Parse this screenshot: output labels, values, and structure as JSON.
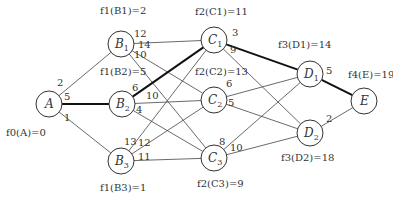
{
  "diagram": {
    "type": "multistage-shortest-path-graph",
    "nodes": [
      {
        "id": "A",
        "label": "A",
        "sub": "",
        "x": 49,
        "y": 104,
        "f_label": "f0(A)=0",
        "fx": 6,
        "fy": 136
      },
      {
        "id": "B1",
        "label": "B",
        "sub": "1",
        "x": 121,
        "y": 44,
        "f_label": "f1(B1)=2",
        "fx": 100,
        "fy": 14
      },
      {
        "id": "B2",
        "label": "B",
        "sub": "2",
        "x": 122,
        "y": 104,
        "f_label": "f1(B2)=5",
        "fx": 100,
        "fy": 75
      },
      {
        "id": "B3",
        "label": "B",
        "sub": "3",
        "x": 121,
        "y": 161,
        "f_label": "f1(B3)=1",
        "fx": 100,
        "fy": 191
      },
      {
        "id": "C1",
        "label": "C",
        "sub": "1",
        "x": 214,
        "y": 40,
        "f_label": "f2(C1)=11",
        "fx": 195,
        "fy": 15
      },
      {
        "id": "C2",
        "label": "C",
        "sub": "2",
        "x": 214,
        "y": 100,
        "f_label": "f2(C2)=13",
        "fx": 195,
        "fy": 75
      },
      {
        "id": "C3",
        "label": "C",
        "sub": "3",
        "x": 214,
        "y": 158,
        "f_label": "f2(C3)=9",
        "fx": 197,
        "fy": 187
      },
      {
        "id": "D1",
        "label": "D",
        "sub": "1",
        "x": 310,
        "y": 74,
        "f_label": "f3(D1)=14",
        "fx": 278,
        "fy": 48
      },
      {
        "id": "D2",
        "label": "D",
        "sub": "2",
        "x": 310,
        "y": 133,
        "f_label": "f3(D2)=18",
        "fx": 281,
        "fy": 161
      },
      {
        "id": "E",
        "label": "E",
        "sub": "",
        "x": 364,
        "y": 101,
        "f_label": "f4(E)=19",
        "fx": 348,
        "fy": 78
      }
    ],
    "edges": [
      {
        "from": "A",
        "to": "B1",
        "weight": "2",
        "bold": false,
        "wx": 57,
        "wy": 86
      },
      {
        "from": "A",
        "to": "B2",
        "weight": "5",
        "bold": true,
        "wx": 64,
        "wy": 100
      },
      {
        "from": "A",
        "to": "B3",
        "weight": "1",
        "bold": false,
        "wx": 64,
        "wy": 121
      },
      {
        "from": "B1",
        "to": "C1",
        "weight": "12",
        "bold": false,
        "wx": 134,
        "wy": 37
      },
      {
        "from": "B1",
        "to": "C2",
        "weight": "14",
        "bold": false,
        "wx": 138,
        "wy": 48
      },
      {
        "from": "B1",
        "to": "C3",
        "weight": "10",
        "bold": false,
        "wx": 134,
        "wy": 58
      },
      {
        "from": "B2",
        "to": "C1",
        "weight": "6",
        "bold": true,
        "wx": 132,
        "wy": 91
      },
      {
        "from": "B2",
        "to": "C2",
        "weight": "10",
        "bold": false,
        "wx": 146,
        "wy": 99
      },
      {
        "from": "B2",
        "to": "C3",
        "weight": "4",
        "bold": false,
        "wx": 136,
        "wy": 113
      },
      {
        "from": "B3",
        "to": "C1",
        "weight": "13",
        "bold": false,
        "wx": 124,
        "wy": 145
      },
      {
        "from": "B3",
        "to": "C2",
        "weight": "12",
        "bold": false,
        "wx": 138,
        "wy": 146
      },
      {
        "from": "B3",
        "to": "C3",
        "weight": "11",
        "bold": false,
        "wx": 138,
        "wy": 160
      },
      {
        "from": "C1",
        "to": "D1",
        "weight": "3",
        "bold": true,
        "wx": 232,
        "wy": 36
      },
      {
        "from": "C1",
        "to": "D2",
        "weight": "9",
        "bold": false,
        "wx": 230,
        "wy": 53
      },
      {
        "from": "C2",
        "to": "D1",
        "weight": "6",
        "bold": false,
        "wx": 226,
        "wy": 87
      },
      {
        "from": "C2",
        "to": "D2",
        "weight": "5",
        "bold": false,
        "wx": 228,
        "wy": 106
      },
      {
        "from": "C3",
        "to": "D1",
        "weight": "8",
        "bold": false,
        "wx": 219,
        "wy": 145
      },
      {
        "from": "C3",
        "to": "D2",
        "weight": "10",
        "bold": false,
        "wx": 230,
        "wy": 151
      },
      {
        "from": "D1",
        "to": "E",
        "weight": "5",
        "bold": true,
        "wx": 326,
        "wy": 74
      },
      {
        "from": "D2",
        "to": "E",
        "weight": "2",
        "bold": false,
        "wx": 326,
        "wy": 122
      }
    ]
  }
}
